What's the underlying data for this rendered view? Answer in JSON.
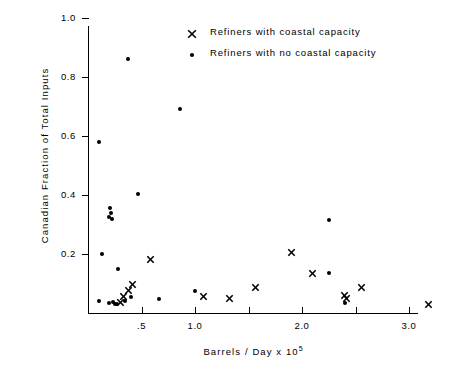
{
  "chart_data": {
    "type": "scatter",
    "title": "",
    "xlabel": "Barrels / Day   x  10⁵",
    "xlabel_text": "Barrels / Day    x   10",
    "xlabel_exponent": "5",
    "ylabel": "Canadian Fraction of Total Inputs",
    "xlim": [
      0.0,
      3.3
    ],
    "ylim": [
      0.0,
      1.08
    ],
    "xticks_labeled": [
      {
        "value": 0.5,
        "label": ".5"
      },
      {
        "value": 1.0,
        "label": "1.0"
      },
      {
        "value": 2.0,
        "label": "2.0"
      },
      {
        "value": 3.0,
        "label": "3.0"
      }
    ],
    "xticks_minor": [
      1.5,
      2.5
    ],
    "yticks_labeled": [
      {
        "value": 0.2,
        "label": "0.2"
      },
      {
        "value": 0.4,
        "label": "0.4"
      },
      {
        "value": 0.6,
        "label": "0.6"
      },
      {
        "value": 0.8,
        "label": "0.8"
      },
      {
        "value": 1.0,
        "label": "1.0"
      }
    ],
    "grid": false,
    "legend_position": "top-center",
    "series": [
      {
        "name": "Refiners with coastal capacity",
        "marker": "cross",
        "marker_icon": "x-marker-icon",
        "color": "#000000",
        "points": [
          [
            0.3,
            0.035
          ],
          [
            0.33,
            0.055
          ],
          [
            0.38,
            0.075
          ],
          [
            0.42,
            0.095
          ],
          [
            0.58,
            0.18
          ],
          [
            1.08,
            0.055
          ],
          [
            1.32,
            0.05
          ],
          [
            1.57,
            0.085
          ],
          [
            1.9,
            0.205
          ],
          [
            2.1,
            0.135
          ],
          [
            2.4,
            0.06
          ],
          [
            2.42,
            0.048
          ],
          [
            2.56,
            0.085
          ],
          [
            3.18,
            0.03
          ]
        ]
      },
      {
        "name": "Refiners with no coastal capacity",
        "marker": "dot",
        "marker_icon": "dot-marker-icon",
        "color": "#000000",
        "points": [
          [
            0.105,
            0.58
          ],
          [
            0.37,
            0.86
          ],
          [
            0.86,
            0.69
          ],
          [
            0.47,
            0.405
          ],
          [
            0.205,
            0.355
          ],
          [
            0.215,
            0.34
          ],
          [
            0.195,
            0.325
          ],
          [
            0.225,
            0.318
          ],
          [
            0.135,
            0.2
          ],
          [
            0.285,
            0.15
          ],
          [
            0.105,
            0.04
          ],
          [
            0.195,
            0.035
          ],
          [
            0.23,
            0.038
          ],
          [
            0.255,
            0.032
          ],
          [
            0.27,
            0.03
          ],
          [
            0.35,
            0.042
          ],
          [
            0.4,
            0.055
          ],
          [
            0.66,
            0.048
          ],
          [
            1.0,
            0.075
          ],
          [
            2.25,
            0.315
          ],
          [
            2.25,
            0.135
          ],
          [
            2.4,
            0.035
          ]
        ]
      }
    ]
  },
  "legend": {
    "items": [
      {
        "label": "Refiners with coastal capacity",
        "marker": "cross"
      },
      {
        "label": "Refiners with no coastal capacity",
        "marker": "dot"
      }
    ]
  }
}
